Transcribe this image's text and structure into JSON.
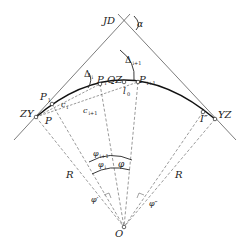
{
  "diagram": {
    "type": "circular-curve-deflection-angle-setout",
    "points": {
      "JD": {
        "label": "JD",
        "desc": "intersection point"
      },
      "ZY": {
        "label": "ZY",
        "desc": "curve start"
      },
      "QZ": {
        "label": "QZ",
        "desc": "curve midpoint"
      },
      "YZ": {
        "label": "YZ",
        "desc": "curve end"
      },
      "O": {
        "label": "O",
        "desc": "circle center"
      },
      "P1": {
        "label": "P",
        "sub": "1"
      },
      "Pi": {
        "label": "P",
        "sub": "i"
      },
      "Pi1": {
        "label": "P",
        "sub": "i+1"
      },
      "P": {
        "label": "P"
      },
      "I2": {
        "label": "I″"
      }
    },
    "angles": {
      "alpha": "α",
      "delta_i": {
        "label": "Δ",
        "sub": "i"
      },
      "delta_i1": {
        "label": "Δ",
        "sub": "i+1"
      },
      "phi": "φ",
      "phi_i": {
        "label": "φ",
        "sub": "i"
      },
      "phi_i1": {
        "label": "φ",
        "sub": "i+1"
      },
      "phi_prime": "φ′",
      "phi_dprime": "φ″"
    },
    "lengths": {
      "c_i": {
        "label": "c",
        "sub": "i"
      },
      "c_i1": {
        "label": "c",
        "sub": "i+1"
      },
      "l0": {
        "label": "l",
        "sub": "0"
      },
      "R_left": "R",
      "R_right": "R"
    },
    "colors": {
      "line": "#333333",
      "curve": "#111111",
      "background": "#ffffff"
    }
  }
}
